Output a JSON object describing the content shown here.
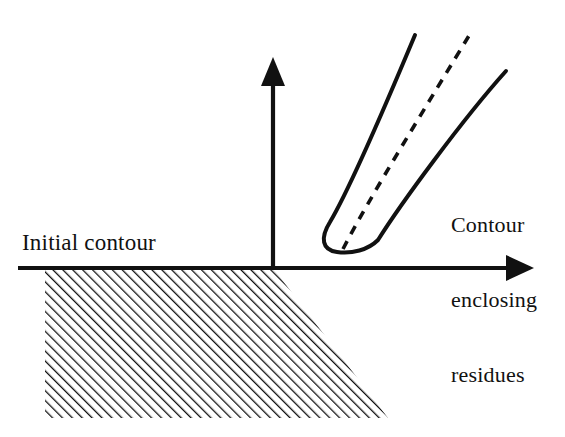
{
  "figure": {
    "type": "technical-line-diagram",
    "background_color": "#ffffff",
    "ink_color": "#111111",
    "width": 565,
    "height": 437
  },
  "labels": {
    "initial_contour": "Initial contour",
    "contour_enclosing_residues": {
      "line1": "Contour",
      "line2": "enclosing",
      "line3": "residues"
    }
  },
  "axes": {
    "origin": {
      "x": 273,
      "y": 268
    },
    "horizontal": {
      "name": "horizontal-axis",
      "start_x": 18,
      "end_x": 532,
      "y": 268,
      "arrowhead": "right"
    },
    "vertical": {
      "name": "vertical-axis",
      "x": 273,
      "start_y": 268,
      "end_y": 58,
      "arrowhead": "up"
    }
  },
  "hatched_region": {
    "name": "initial-contour-region",
    "fill": "diagonal-hatch",
    "hatch_angle_deg": 45,
    "hatch_spacing_px": 7,
    "vertices": [
      {
        "x": 45,
        "y": 268
      },
      {
        "x": 273,
        "y": 268
      },
      {
        "x": 388,
        "y": 418
      },
      {
        "x": 45,
        "y": 418
      }
    ]
  },
  "contour_tube": {
    "name": "contour-enclosing-residues-shape",
    "style": "solid",
    "description": "elongated U-shaped contour with rounded tip near the axis opening up-right",
    "left_branch": {
      "from": {
        "x": 327,
        "y": 243
      },
      "to": {
        "x": 415,
        "y": 35
      }
    },
    "right_branch": {
      "from": {
        "x": 377,
        "y": 241
      },
      "to": {
        "x": 506,
        "y": 71
      }
    },
    "tip": {
      "x": 351,
      "y": 252
    }
  },
  "branch_cut": {
    "name": "branch-cut-dashed-line",
    "style": "dashed",
    "dash_length_px": 9,
    "gap_length_px": 8,
    "from": {
      "x": 343,
      "y": 248
    },
    "to": {
      "x": 470,
      "y": 34
    }
  }
}
